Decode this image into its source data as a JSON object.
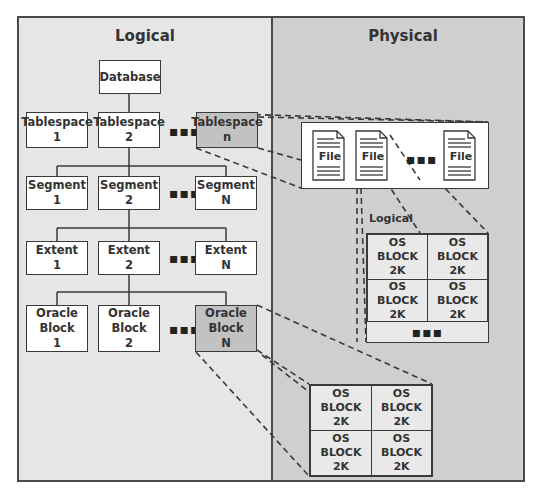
{
  "panels": {
    "logical": {
      "title": "Logical",
      "bg": "#e6e6e6"
    },
    "physical": {
      "title": "Physical",
      "bg": "#cfcfcf"
    }
  },
  "hierarchy": {
    "database": {
      "label": "Database"
    },
    "tablespaces": [
      {
        "line1": "Tablespace",
        "line2": "1",
        "shaded": false
      },
      {
        "line1": "Tablespace",
        "line2": "2",
        "shaded": false
      },
      {
        "line1": "Tablespace",
        "line2": "n",
        "shaded": true
      }
    ],
    "segments": [
      {
        "line1": "Segment",
        "line2": "1"
      },
      {
        "line1": "Segment",
        "line2": "2"
      },
      {
        "line1": "Segment",
        "line2": "N"
      }
    ],
    "extents": [
      {
        "line1": "Extent",
        "line2": "1"
      },
      {
        "line1": "Extent",
        "line2": "2"
      },
      {
        "line1": "Extent",
        "line2": "N"
      }
    ],
    "oracle_blocks": [
      {
        "line1": "Oracle",
        "line2": "Block",
        "line3": "1",
        "shaded": false
      },
      {
        "line1": "Oracle",
        "line2": "Block",
        "line3": "2",
        "shaded": false
      },
      {
        "line1": "Oracle",
        "line2": "Block",
        "line3": "N",
        "shaded": true
      }
    ],
    "ellipsis": "▪▪▪"
  },
  "physical": {
    "files": [
      {
        "label": "File"
      },
      {
        "label": "File"
      },
      {
        "label": "File"
      }
    ],
    "files_ellipsis": "▪▪▪",
    "logical_label": "Logical",
    "os_block_group_1": {
      "cells": [
        {
          "line1": "OS",
          "line2": "BLOCK",
          "line3": "2K"
        },
        {
          "line1": "OS",
          "line2": "BLOCK",
          "line3": "2K"
        },
        {
          "line1": "OS",
          "line2": "BLOCK",
          "line3": "2K"
        },
        {
          "line1": "OS",
          "line2": "BLOCK",
          "line3": "2K"
        }
      ],
      "ellipsis": "▪▪▪"
    },
    "os_block_group_2": {
      "cells": [
        {
          "line1": "OS",
          "line2": "BLOCK",
          "line3": "2K"
        },
        {
          "line1": "OS",
          "line2": "BLOCK",
          "line3": "2K"
        },
        {
          "line1": "OS",
          "line2": "BLOCK",
          "line3": "2K"
        },
        {
          "line1": "OS",
          "line2": "BLOCK",
          "line3": "2K"
        }
      ]
    }
  },
  "colors": {
    "border": "#3a3a3a",
    "shaded_box": "#c2c2c2",
    "box": "#ffffff"
  }
}
